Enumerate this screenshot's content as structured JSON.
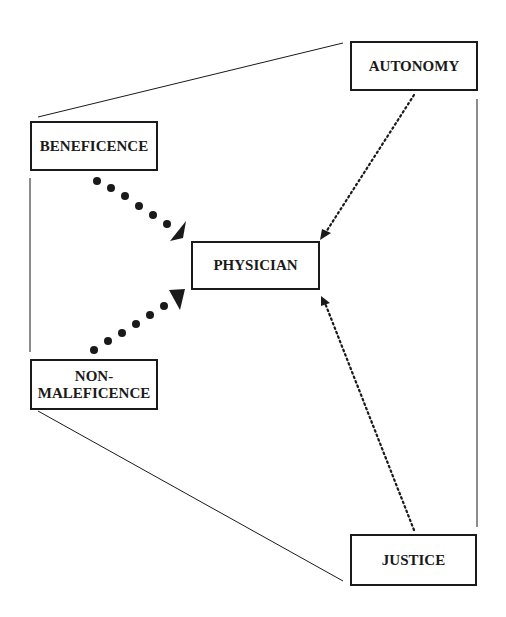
{
  "diagram": {
    "type": "concept-map",
    "colors": {
      "stroke": "#1a1a1a",
      "background": "#ffffff"
    },
    "nodes": {
      "beneficence": {
        "label": "BENEFICENCE"
      },
      "autonomy": {
        "label": "AUTONOMY"
      },
      "physician": {
        "label": "PHYSICIAN"
      },
      "non_maleficence": {
        "line1": "NON-",
        "line2": "MALEFICENCE"
      },
      "justice": {
        "label": "JUSTICE"
      }
    },
    "edges": [
      {
        "from": "beneficence",
        "to": "physician",
        "style": "heavy-dotted-arrow"
      },
      {
        "from": "non_maleficence",
        "to": "physician",
        "style": "heavy-dotted-arrow"
      },
      {
        "from": "autonomy",
        "to": "physician",
        "style": "fine-dotted-arrow"
      },
      {
        "from": "justice",
        "to": "physician",
        "style": "fine-dotted-arrow"
      },
      {
        "from": "beneficence",
        "to": "autonomy",
        "style": "solid-line"
      },
      {
        "from": "autonomy",
        "to": "justice",
        "style": "solid-line"
      },
      {
        "from": "justice",
        "to": "non_maleficence",
        "style": "solid-line"
      },
      {
        "from": "non_maleficence",
        "to": "beneficence",
        "style": "solid-line"
      }
    ]
  }
}
